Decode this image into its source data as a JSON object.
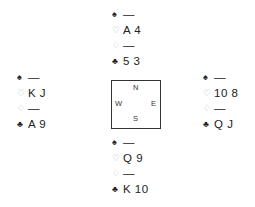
{
  "hands": {
    "north": [
      {
        "suit": "spades",
        "symbol": "♠",
        "cards": "—"
      },
      {
        "suit": "hearts",
        "symbol": "♡",
        "cards": "A 4"
      },
      {
        "suit": "diamonds",
        "symbol": "♢",
        "cards": "—"
      },
      {
        "suit": "clubs",
        "symbol": "♣",
        "cards": "5 3"
      }
    ],
    "west": [
      {
        "suit": "spades",
        "symbol": "♠",
        "cards": "—"
      },
      {
        "suit": "hearts",
        "symbol": "♡",
        "cards": "K J"
      },
      {
        "suit": "diamonds",
        "symbol": "♢",
        "cards": "—"
      },
      {
        "suit": "clubs",
        "symbol": "♣",
        "cards": "A 9"
      }
    ],
    "east": [
      {
        "suit": "spades",
        "symbol": "♠",
        "cards": "—"
      },
      {
        "suit": "hearts",
        "symbol": "♡",
        "cards": "10 8"
      },
      {
        "suit": "diamonds",
        "symbol": "♢",
        "cards": "—"
      },
      {
        "suit": "clubs",
        "symbol": "♣",
        "cards": "Q J"
      }
    ],
    "south": [
      {
        "suit": "spades",
        "symbol": "♠",
        "cards": "—"
      },
      {
        "suit": "hearts",
        "symbol": "♡",
        "cards": "Q 9"
      },
      {
        "suit": "diamonds",
        "symbol": "♢",
        "cards": "—"
      },
      {
        "suit": "clubs",
        "symbol": "♣",
        "cards": "K 10"
      }
    ]
  },
  "compass": {
    "n": "N",
    "s": "S",
    "e": "E",
    "w": "W"
  }
}
